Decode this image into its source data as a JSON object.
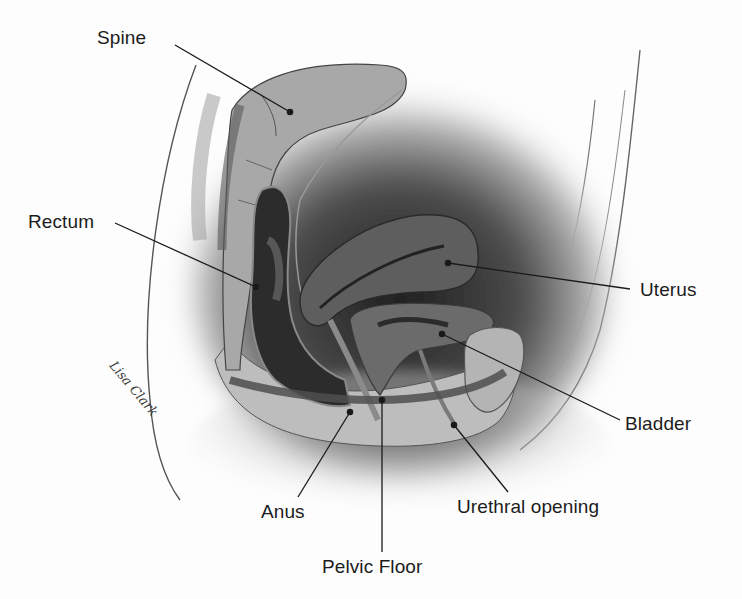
{
  "diagram": {
    "signature": "Lisa Clark",
    "labels": [
      {
        "id": "spine",
        "text": "Spine",
        "x": 97,
        "y": 28,
        "anchor": [
          175,
          45
        ],
        "target": [
          290,
          112
        ]
      },
      {
        "id": "rectum",
        "text": "Rectum",
        "x": 28,
        "y": 212,
        "anchor": [
          115,
          223
        ],
        "target": [
          256,
          287
        ]
      },
      {
        "id": "uterus",
        "text": "Uterus",
        "x": 640,
        "y": 280,
        "anchor": [
          630,
          289
        ],
        "target": [
          448,
          263
        ]
      },
      {
        "id": "bladder",
        "text": "Bladder",
        "x": 625,
        "y": 414,
        "anchor": [
          620,
          420
        ],
        "target": [
          442,
          334
        ]
      },
      {
        "id": "anus",
        "text": "Anus",
        "x": 261,
        "y": 502,
        "anchor": [
          298,
          497
        ],
        "target": [
          350,
          412
        ]
      },
      {
        "id": "pelvic-floor",
        "text": "Pelvic Floor",
        "x": 322,
        "y": 557,
        "anchor": [
          382,
          552
        ],
        "target": [
          382,
          400
        ]
      },
      {
        "id": "urethral-opening",
        "text": "Urethral opening",
        "x": 457,
        "y": 497,
        "anchor": [
          508,
          492
        ],
        "target": [
          454,
          425
        ]
      }
    ]
  },
  "colors": {
    "label_text": "#1c1c1c",
    "leader_line": "#1a1a1a",
    "tissue_dark": "#2e2e2e",
    "tissue_mid": "#6d6d6d",
    "tissue_light": "#a9a9a9",
    "tissue_pale": "#c8c8c8",
    "background": "#fdfdfd"
  }
}
